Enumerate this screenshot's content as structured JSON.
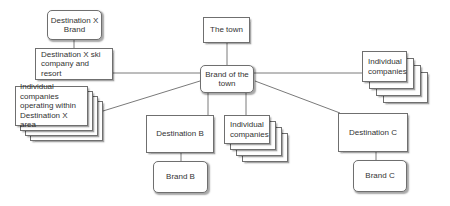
{
  "diagram": {
    "nodes": {
      "destination_x_brand": "Destination X Brand",
      "destination_x_ski": "Destination X ski company and resort",
      "individual_companies_x": "Individual companies operating within Destination X area",
      "the_town": "The town",
      "brand_of_town": "Brand of the town",
      "individual_companies_right": "Individual companies",
      "destination_b": "Destination B",
      "brand_b": "Brand B",
      "individual_companies_middle": "Individual companies",
      "destination_c": "Destination C",
      "brand_c": "Brand C"
    },
    "edges": [
      [
        "destination_x_brand",
        "destination_x_ski"
      ],
      [
        "destination_x_ski",
        "brand_of_town"
      ],
      [
        "individual_companies_x",
        "brand_of_town"
      ],
      [
        "the_town",
        "brand_of_town"
      ],
      [
        "brand_of_town",
        "individual_companies_right"
      ],
      [
        "brand_of_town",
        "destination_b"
      ],
      [
        "brand_of_town",
        "individual_companies_middle"
      ],
      [
        "brand_of_town",
        "destination_c"
      ],
      [
        "destination_b",
        "brand_b"
      ],
      [
        "destination_c",
        "brand_c"
      ]
    ],
    "colors": {
      "border": "#6f6f6f",
      "line": "#7a7a7a",
      "text": "#333333",
      "background": "#ffffff"
    }
  }
}
